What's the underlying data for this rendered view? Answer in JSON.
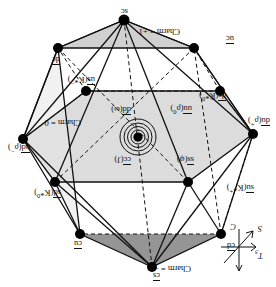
{
  "figure": {
    "orientation_degrees": 180,
    "background": "#ffffff",
    "line_color": "#111111",
    "face_fill_light": "#d9d9d9",
    "face_fill_dark": "#8f8f8f",
    "vertex_color": "#000000"
  },
  "axes": {
    "t3": "T",
    "t3_sub": "3",
    "s": "S",
    "c": "C"
  },
  "planes": [
    {
      "id": "charm-plus-1",
      "label": "Charm = +1"
    },
    {
      "id": "charm-zero",
      "label": "Charm = 0"
    },
    {
      "id": "charm-minus-1",
      "label": "Charm = −1"
    }
  ],
  "vertices": [
    {
      "id": "cs",
      "quark": "c",
      "antiquark": "s",
      "text": "cs",
      "plane": "charm-plus-1"
    },
    {
      "id": "cd",
      "quark": "c",
      "antiquark": "d",
      "text": "cd",
      "plane": "charm-plus-1"
    },
    {
      "id": "cu",
      "quark": "c",
      "antiquark": "u",
      "text": "cu",
      "plane": "charm-plus-1"
    },
    {
      "id": "sc",
      "quark": "s",
      "antiquark": "c",
      "text": "sc",
      "plane": "charm-minus-1"
    },
    {
      "id": "uc",
      "quark": "u",
      "antiquark": "c",
      "text": "uc",
      "plane": "charm-minus-1"
    },
    {
      "id": "dc",
      "quark": "d",
      "antiquark": "c",
      "text": "dc",
      "plane": "charm-minus-1"
    },
    {
      "id": "ud",
      "quark": "u",
      "antiquark": "d",
      "text": "ud",
      "meson": "ρ",
      "charge": "−",
      "plane": "charm-zero"
    },
    {
      "id": "du",
      "quark": "d",
      "antiquark": "u",
      "text": "du",
      "meson": "ρ",
      "charge": "+",
      "plane": "charm-zero"
    },
    {
      "id": "us",
      "quark": "u",
      "antiquark": "s",
      "text": "us",
      "meson": "K*",
      "charge": "−",
      "plane": "charm-zero"
    },
    {
      "id": "su",
      "quark": "s",
      "antiquark": "u",
      "text": "su",
      "meson": "K*",
      "charge": "+",
      "plane": "charm-zero"
    },
    {
      "id": "sd",
      "quark": "s",
      "antiquark": "d",
      "text": "sd",
      "meson": "K*",
      "charge": "0",
      "plane": "charm-zero"
    },
    {
      "id": "ds",
      "quark": "d",
      "antiquark": "s",
      "text": "ds",
      "meson": "K̄*",
      "charge": "0",
      "plane": "charm-zero"
    }
  ],
  "center_states": [
    {
      "id": "cc",
      "text": "cc",
      "meson": "J",
      "charge": ""
    },
    {
      "id": "ss",
      "text": "ss",
      "meson": "φ",
      "charge": ""
    },
    {
      "id": "dd",
      "text": "dd",
      "meson": "ω",
      "charge": ""
    },
    {
      "id": "uu",
      "text": "uu",
      "meson": "ρ",
      "charge": "0"
    }
  ],
  "center_marker": {
    "id": "origin",
    "rings": 4,
    "filled_dot": true
  }
}
